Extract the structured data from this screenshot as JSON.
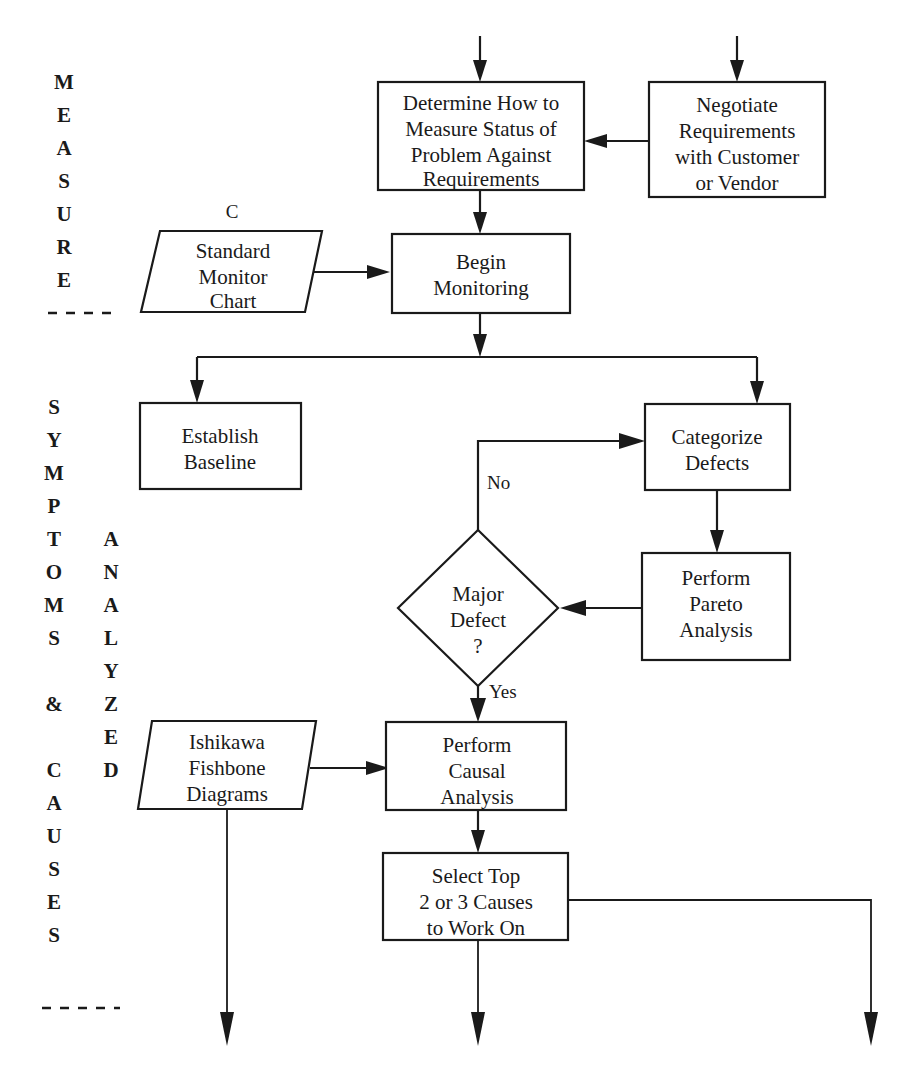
{
  "diagram": {
    "background_color": "#ffffff",
    "line_color": "#1a1a1a"
  },
  "bands": [
    {
      "id": "measure",
      "label": "MEASURE",
      "letters": [
        "M",
        "E",
        "A",
        "S",
        "U",
        "R",
        "E"
      ]
    },
    {
      "id": "symptoms-causes",
      "label": "SYMPTOMS & CAUSES",
      "letters": [
        "S",
        "Y",
        "M",
        "P",
        "T",
        "O",
        "M",
        "S",
        "",
        "&",
        "",
        "C",
        "A",
        "U",
        "S",
        "E",
        "S"
      ]
    },
    {
      "id": "analyzed",
      "label": "ANALYZED",
      "letters": [
        "A",
        "N",
        "A",
        "L",
        "Y",
        "Z",
        "E",
        "D"
      ]
    }
  ],
  "nodes": [
    {
      "id": "determine-measure",
      "shape": "process",
      "lines": [
        "Determine How to",
        "Measure Status of",
        "Problem Against",
        "Requirements"
      ]
    },
    {
      "id": "negotiate-requirements",
      "shape": "process",
      "lines": [
        "Negotiate",
        "Requirements",
        "with Customer",
        "or Vendor"
      ]
    },
    {
      "id": "standard-monitor-chart",
      "shape": "data-parallelogram",
      "corner_label": "C",
      "lines": [
        "Standard",
        "Monitor",
        "Chart"
      ]
    },
    {
      "id": "begin-monitoring",
      "shape": "process",
      "lines": [
        "Begin",
        "Monitoring"
      ]
    },
    {
      "id": "establish-baseline",
      "shape": "process",
      "lines": [
        "Establish",
        "Baseline"
      ]
    },
    {
      "id": "categorize-defects",
      "shape": "process",
      "lines": [
        "Categorize",
        "Defects"
      ]
    },
    {
      "id": "perform-pareto-analysis",
      "shape": "process",
      "lines": [
        "Perform",
        "Pareto",
        "Analysis"
      ]
    },
    {
      "id": "major-defect-decision",
      "shape": "decision",
      "lines": [
        "Major",
        "Defect",
        "?"
      ]
    },
    {
      "id": "ishikawa-fishbone",
      "shape": "data-parallelogram",
      "lines": [
        "Ishikawa",
        "Fishbone",
        "Diagrams"
      ]
    },
    {
      "id": "perform-causal-analysis",
      "shape": "process",
      "lines": [
        "Perform",
        "Causal",
        "Analysis"
      ]
    },
    {
      "id": "select-top-causes",
      "shape": "process",
      "lines": [
        "Select Top",
        "2 or 3 Causes",
        "to Work On"
      ]
    }
  ],
  "edge_labels": {
    "decision_no": "No",
    "decision_yes": "Yes"
  }
}
